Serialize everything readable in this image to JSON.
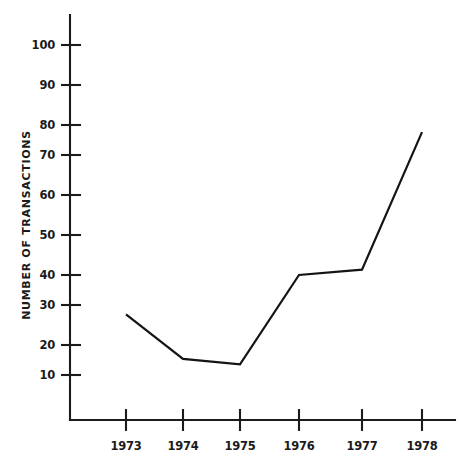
{
  "chart_data": {
    "type": "line",
    "title": "",
    "subtitle": "",
    "xlabel": "",
    "ylabel": "NUMBER OF TRANSACTIONS",
    "categories": [
      "1973",
      "1974",
      "1975",
      "1976",
      "1977",
      "1978"
    ],
    "x": [
      1973,
      1974,
      1975,
      1976,
      1977,
      1978
    ],
    "values": [
      27,
      14.5,
      13,
      38,
      39.5,
      78
    ],
    "series": [
      {
        "name": "Number of transactions",
        "values": [
          27,
          14.5,
          13,
          38,
          39.5,
          78
        ]
      }
    ],
    "ylim": [
      0,
      105
    ],
    "xlim": [
      1972.5,
      1978.5
    ],
    "ytick_labels": [
      "10",
      "20",
      "30",
      "40",
      "50",
      "60",
      "70",
      "80",
      "90",
      "100"
    ],
    "ytick_values": [
      10,
      20,
      30,
      40,
      50,
      60,
      70,
      80,
      90,
      100
    ],
    "xtick_labels": [
      "1973",
      "1974",
      "1975",
      "1976",
      "1977",
      "1978"
    ],
    "grid": false,
    "legend": false,
    "legend_position": "none",
    "line_color": "#141414",
    "axis_color": "#1b1b1b",
    "background_color": "#ffffff",
    "annotations": []
  },
  "axes": {
    "y": {
      "label": "NUMBER OF TRANSACTIONS",
      "ticks": [
        {
          "label": "100",
          "value": 100
        },
        {
          "label": "90",
          "value": 90
        },
        {
          "label": "80",
          "value": 80
        },
        {
          "label": "70",
          "value": 70
        },
        {
          "label": "60",
          "value": 60
        },
        {
          "label": "50",
          "value": 50
        },
        {
          "label": "40",
          "value": 40
        },
        {
          "label": "30",
          "value": 30
        },
        {
          "label": "20",
          "value": 20
        },
        {
          "label": "10",
          "value": 10
        }
      ]
    },
    "x": {
      "label": "",
      "ticks": [
        {
          "label": "1973",
          "value": 1973
        },
        {
          "label": "1974",
          "value": 1974
        },
        {
          "label": "1975",
          "value": 1975
        },
        {
          "label": "1976",
          "value": 1976
        },
        {
          "label": "1977",
          "value": 1977
        },
        {
          "label": "1978",
          "value": 1978
        }
      ]
    }
  }
}
